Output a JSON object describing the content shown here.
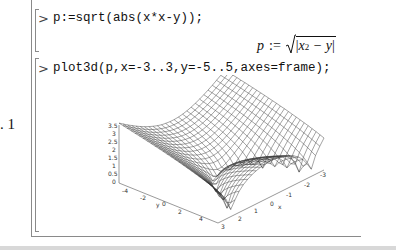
{
  "worksheet": {
    "groups": [
      {
        "prompt": ">",
        "input": "p:=sqrt(abs(x*x-y));",
        "output": {
          "lhs": "p",
          "assign": ":=",
          "radicand_left": "x",
          "radicand_exp": "2",
          "radicand_right": " − y"
        }
      },
      {
        "prompt": ">",
        "input": "plot3d(p,x=-3..3,y=-5..5,axes=frame);",
        "output": {
          "equation_label": ". 1"
        }
      }
    ]
  },
  "chart_data": {
    "type": "surface3d",
    "title": "",
    "function": "sqrt(abs(x^2 - y))",
    "xlabel": "x",
    "ylabel": "y",
    "zlabel": "",
    "x_range": [
      -3,
      3
    ],
    "y_range": [
      -5,
      5
    ],
    "z_ticks": [
      "0",
      "0.5",
      "1",
      "1.5",
      "2",
      "2.5",
      "3",
      "3.5"
    ],
    "x_ticks": [
      "3",
      "2",
      "1",
      "0",
      "-1",
      "-2",
      "-3"
    ],
    "y_ticks": [
      "-4",
      "-2",
      "0",
      "2",
      "4"
    ],
    "axes": "frame",
    "grid": true,
    "legend": null,
    "z_range": [
      0,
      3.6
    ]
  }
}
